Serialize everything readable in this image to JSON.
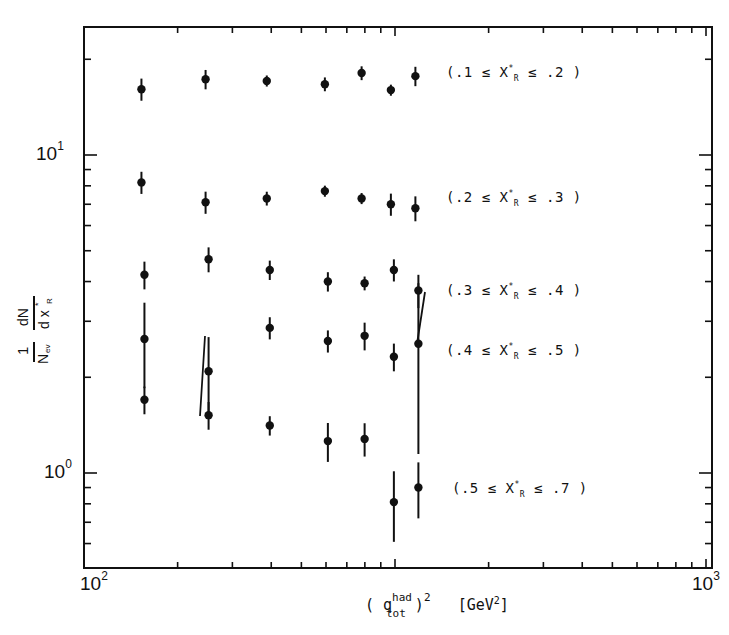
{
  "chart_data": {
    "type": "scatter",
    "title": "",
    "xlabel": "( q_tot^had )^2 [GeV^2]",
    "ylabel": "1/N_ev dN/dx_R*",
    "x_scale": "log",
    "y_scale": "log",
    "x_tick_labels": [
      "10²",
      "10³"
    ],
    "y_tick_labels": [
      "10¹",
      "10⁰"
    ],
    "xlim": [
      100,
      10000
    ],
    "ylim": [
      0.35,
      30
    ],
    "grid": false,
    "legend_position": "inline-right",
    "error_bars": true,
    "x": [
      153,
      246,
      387,
      595,
      781,
      970,
      1163
    ],
    "series": [
      {
        "name": "(.1 ≤ x_R* ≤ .2)",
        "values": [
          16.1,
          17.3,
          17.1,
          16.7,
          18.1,
          16.0,
          17.7
        ]
      },
      {
        "name": "(.2 ≤ x_R* ≤ .3)",
        "values": [
          8.2,
          7.1,
          7.3,
          7.7,
          7.3,
          7.0,
          6.8
        ]
      },
      {
        "name": "(.3 ≤ x_R* ≤ .4)",
        "values": [
          4.2,
          4.7,
          4.35,
          4.0,
          3.95,
          4.35,
          3.75
        ]
      },
      {
        "name": "(.4 ≤ x_R* ≤ .5)",
        "values": [
          2.64,
          2.09,
          2.86,
          2.6,
          2.7,
          2.32,
          2.55
        ]
      },
      {
        "name": "(.5 ≤ x_R* ≤ .7)",
        "values": [
          1.7,
          1.52,
          1.41,
          1.26,
          1.28,
          0.81,
          0.9
        ]
      }
    ]
  },
  "axes": {
    "x_tick_left": "10",
    "x_tick_left_exp": "2",
    "x_tick_right": "10",
    "x_tick_right_exp": "3",
    "y_tick_upper": "10",
    "y_tick_upper_exp": "1",
    "y_tick_lower": "10",
    "y_tick_lower_exp": "0",
    "x_label_open": "( q",
    "x_label_sup": "had",
    "x_label_sub": "tot",
    "x_label_close": " )",
    "x_label_pow": "2",
    "x_label_unit": "[GeV",
    "x_label_unit_pow": "2",
    "x_label_unit_close": "]"
  },
  "legend": [
    {
      "open": "(.1 ≤ X",
      "sup": "*",
      "sub": "R",
      "close": " ≤ .2 )"
    },
    {
      "open": "(.2 ≤ X",
      "sup": "*",
      "sub": "R",
      "close": " ≤ .3  )"
    },
    {
      "open": "(.3 ≤ X",
      "sup": "*",
      "sub": "R",
      "close": " ≤ .4  )"
    },
    {
      "open": "(.4 ≤ X",
      "sup": "*",
      "sub": "R",
      "close": " ≤ .5 )"
    },
    {
      "open": "(.5 ≤ X",
      "sup": "*",
      "sub": "R",
      "close": " ≤ .7 )"
    }
  ]
}
